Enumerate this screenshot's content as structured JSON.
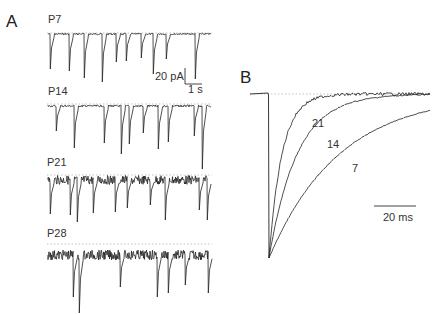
{
  "figure": {
    "panels": [
      {
        "id": "A",
        "label": "A"
      },
      {
        "id": "B",
        "label": "B"
      }
    ],
    "panel_a": {
      "traces": [
        {
          "label": "P7"
        },
        {
          "label": "P14"
        },
        {
          "label": "P21"
        },
        {
          "label": "P28"
        }
      ],
      "scalebar": {
        "amplitude": "20 pA",
        "time": "1 s"
      }
    },
    "panel_b": {
      "curve_labels": [
        "21",
        "14",
        "7"
      ],
      "scalebar": {
        "time": "20 ms"
      }
    }
  }
}
